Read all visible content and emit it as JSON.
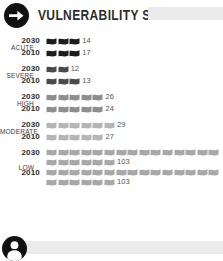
{
  "header": {
    "title": "VULNERABILITY SHIFT",
    "icon": "arrow-right-circle-icon",
    "placeholder_label": ""
  },
  "footer": {
    "icon": "person-circle-icon",
    "placeholder_label": ""
  },
  "colors": {
    "acute": "#1c1c1c",
    "severe": "#4a4a4a",
    "high": "#8e8e8e",
    "moderate": "#b5b5b5",
    "low": "#a8a8a8",
    "badge": "#111111",
    "placeholder": "#ebebeb",
    "year_text": "#2b2b2b",
    "value_text": "#555555"
  },
  "chart_data": {
    "type": "bar",
    "title": "VULNERABILITY SHIFT",
    "xlabel": "",
    "ylabel": "",
    "unit_note": "each icon ≈ 5 units",
    "categories": [
      "ACUTE",
      "SEVERE",
      "HIGH",
      "MODERATE",
      "LOW"
    ],
    "series": [
      {
        "name": "2030",
        "values": [
          14,
          12,
          26,
          29,
          103
        ]
      },
      {
        "name": "2010",
        "values": [
          17,
          13,
          24,
          27,
          103
        ]
      }
    ],
    "groups": [
      {
        "label": "ACUTE",
        "color": "#1c1c1c",
        "rows": [
          {
            "year": "2030",
            "value": 14,
            "icons": 3
          },
          {
            "year": "2010",
            "value": 17,
            "icons": 3
          }
        ]
      },
      {
        "label": "SEVERE",
        "color": "#4a4a4a",
        "rows": [
          {
            "year": "2030",
            "value": 12,
            "icons": 2
          },
          {
            "year": "2010",
            "value": 13,
            "icons": 3
          }
        ]
      },
      {
        "label": "HIGH",
        "color": "#8e8e8e",
        "rows": [
          {
            "year": "2030",
            "value": 26,
            "icons": 5
          },
          {
            "year": "2010",
            "value": 24,
            "icons": 5
          }
        ]
      },
      {
        "label": "MODERATE",
        "color": "#b5b5b5",
        "rows": [
          {
            "year": "2030",
            "value": 29,
            "icons": 6
          },
          {
            "year": "2010",
            "value": 27,
            "icons": 5
          }
        ]
      },
      {
        "label": "LOW",
        "color": "#a8a8a8",
        "rows": [
          {
            "year": "2030",
            "value": 103,
            "icons": 21
          },
          {
            "year": "2010",
            "value": 103,
            "icons": 21
          }
        ]
      }
    ]
  }
}
